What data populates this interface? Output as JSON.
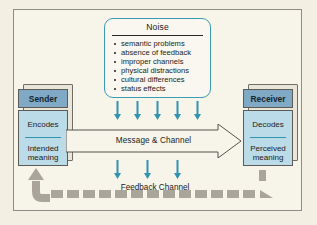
{
  "diagram": {
    "noise": {
      "heading": "Noise",
      "items": [
        "semantic problems",
        "absence of feedback",
        "improper channels",
        "physical distractions",
        "cultural differences",
        "status effects"
      ]
    },
    "sender": {
      "header": "Sender",
      "step": "Encodes",
      "detail": "Intended\nmeaning"
    },
    "receiver": {
      "header": "Receiver",
      "step": "Decodes",
      "detail": "Perceived\nmeaning"
    },
    "message_channel_label": "Message & Channel",
    "feedback_channel_label": "Feedback Channel",
    "colors": {
      "page_background": "#f3efe3",
      "panel_background": "#f7f4ea",
      "panel_border": "#8e8c84",
      "noise_border": "#3b9cb5",
      "entity_header": "#7fa9c4",
      "entity_body": "#bcdbe8",
      "entity_divider": "#2f94b0",
      "arrow_teal": "#2f94b0",
      "feedback_gray": "#a9a59a",
      "block_depth": "#e9e5d8",
      "text": "#1c1a16"
    },
    "noise_arrows_upper_count": 5,
    "noise_arrows_lower_count": 3
  }
}
